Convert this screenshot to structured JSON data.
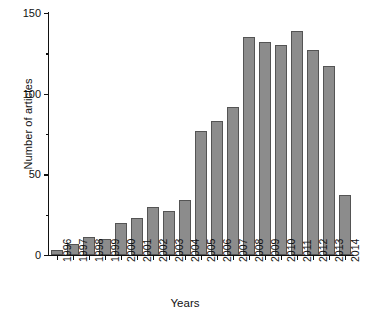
{
  "chart_data": {
    "type": "bar",
    "title": "",
    "xlabel": "Years",
    "ylabel": "Number of articles",
    "categories": [
      "1996",
      "1997",
      "1998",
      "1999",
      "2000",
      "2001",
      "2002",
      "2003",
      "2004",
      "2005",
      "2006",
      "2007",
      "2008",
      "2009",
      "2010",
      "2011",
      "2012",
      "2013",
      "2014"
    ],
    "values": [
      3,
      7,
      11,
      10,
      20,
      23,
      30,
      27,
      34,
      77,
      83,
      92,
      135,
      132,
      130,
      139,
      127,
      117,
      37
    ],
    "series": [
      {
        "name": "Number of articles",
        "values": [
          3,
          7,
          11,
          10,
          20,
          23,
          30,
          27,
          34,
          77,
          83,
          92,
          135,
          132,
          130,
          139,
          127,
          117,
          37
        ]
      }
    ],
    "ylim": [
      0,
      150
    ],
    "ytick_major": [
      0,
      50,
      100,
      150
    ],
    "ytick_major_labels": [
      "0",
      "50",
      "100",
      "150"
    ],
    "ytick_minor": [
      25,
      75,
      125
    ],
    "grid": false,
    "legend": false,
    "legend_position": "none",
    "bar_color": "#8c8c8c",
    "bar_edge_color": "#545454",
    "axis_color": "#111111",
    "background_color": "#ffffff"
  },
  "axes": {
    "y_title": "Number of articles",
    "x_title": "Years"
  }
}
